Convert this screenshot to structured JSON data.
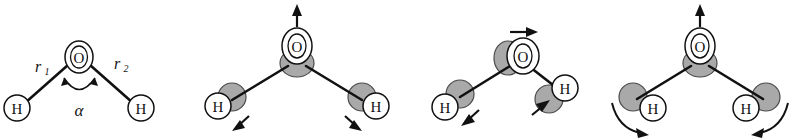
{
  "figure": {
    "background_color": "#ffffff",
    "width": 801,
    "height": 139,
    "colors": {
      "line": "#111111",
      "atom_fill": "#ffffff",
      "displaced_atom_fill": "#a9a9a9",
      "displaced_atom_stroke": "#4a4a4a"
    }
  },
  "panels": [
    {
      "id": "geometry",
      "name": "equilibrium-geometry",
      "atoms": [
        {
          "label": "O",
          "role": "oxygen"
        },
        {
          "label": "H",
          "role": "hydrogen-left"
        },
        {
          "label": "H",
          "role": "hydrogen-right"
        }
      ],
      "labels": {
        "bond_left": "r",
        "bond_left_sub": "1",
        "bond_right": "r",
        "bond_right_sub": "2",
        "angle": "α"
      },
      "displacement_arrows": []
    },
    {
      "id": "symmetric-stretch",
      "name": "symmetric-stretch-mode",
      "atoms": [
        {
          "label": "O",
          "role": "oxygen"
        },
        {
          "label": "H",
          "role": "hydrogen-left"
        },
        {
          "label": "H",
          "role": "hydrogen-right"
        }
      ],
      "labels": {},
      "displacement_arrows": [
        {
          "atom": "O",
          "direction": "up"
        },
        {
          "atom": "H-left",
          "direction": "down-left"
        },
        {
          "atom": "H-right",
          "direction": "down-right"
        }
      ]
    },
    {
      "id": "asymmetric-stretch",
      "name": "asymmetric-stretch-mode",
      "atoms": [
        {
          "label": "O",
          "role": "oxygen"
        },
        {
          "label": "H",
          "role": "hydrogen-left"
        },
        {
          "label": "H",
          "role": "hydrogen-right"
        }
      ],
      "labels": {},
      "displacement_arrows": [
        {
          "atom": "O",
          "direction": "right"
        },
        {
          "atom": "H-left",
          "direction": "down-left"
        },
        {
          "atom": "H-right",
          "direction": "up-left"
        }
      ]
    },
    {
      "id": "bending",
      "name": "bending-mode",
      "atoms": [
        {
          "label": "O",
          "role": "oxygen"
        },
        {
          "label": "H",
          "role": "hydrogen-left"
        },
        {
          "label": "H",
          "role": "hydrogen-right"
        }
      ],
      "labels": {},
      "displacement_arrows": [
        {
          "atom": "O",
          "direction": "up"
        },
        {
          "atom": "H-left",
          "direction": "curved-clockwise-down"
        },
        {
          "atom": "H-right",
          "direction": "curved-counterclockwise-down"
        }
      ]
    }
  ]
}
